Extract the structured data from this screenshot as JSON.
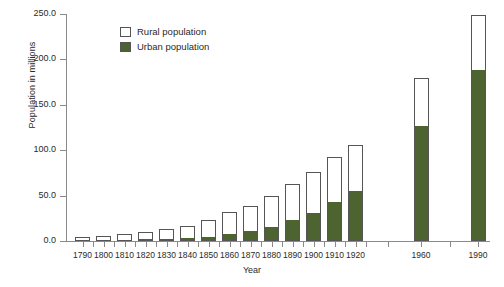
{
  "chart_data": {
    "type": "bar",
    "subtype": "stacked-vertical",
    "title": "",
    "xlabel": "Year",
    "ylabel": "Population in millions",
    "ylim": [
      0.0,
      250.0
    ],
    "yticks": [
      0.0,
      50.0,
      100.0,
      150.0,
      200.0,
      250.0
    ],
    "ytick_labels": [
      "0.0",
      "50.0",
      "100.0",
      "150.0",
      "200.0",
      "250.0"
    ],
    "grid": false,
    "legend_position": "upper-left-inside",
    "categories": [
      "1790",
      "1800",
      "1810",
      "1820",
      "1830",
      "1840",
      "1850",
      "1860",
      "1870",
      "1880",
      "1890",
      "1900",
      "1910",
      "1920",
      "1960",
      "1990"
    ],
    "series": [
      {
        "name": "Urban population",
        "color": "#4d6330",
        "values": [
          0.2,
          0.3,
          0.5,
          0.7,
          1.1,
          1.8,
          3.5,
          6.2,
          9.9,
          14.1,
          22.1,
          30.2,
          42.0,
          54.2,
          125.3,
          187.1
        ]
      },
      {
        "name": "Rural population",
        "color": "#ffffff",
        "values": [
          3.7,
          4.9,
          6.7,
          8.9,
          11.7,
          15.2,
          19.6,
          25.2,
          28.7,
          36.0,
          40.8,
          45.8,
          50.0,
          51.6,
          54.1,
          61.7
        ]
      }
    ],
    "totals": [
      3.9,
      5.2,
      7.2,
      9.6,
      12.8,
      17.0,
      23.1,
      31.4,
      38.6,
      50.1,
      62.9,
      76.0,
      92.0,
      105.8,
      179.4,
      248.8
    ],
    "unlabeled_ticks_between": [
      "1920",
      "1960"
    ]
  },
  "legend": {
    "items": [
      {
        "label": "Rural population",
        "swatch": "rural-swatch"
      },
      {
        "label": "Urban population",
        "swatch": "urban-swatch"
      }
    ]
  },
  "axes": {
    "y_title": "Population in millions",
    "x_title": "Year"
  }
}
